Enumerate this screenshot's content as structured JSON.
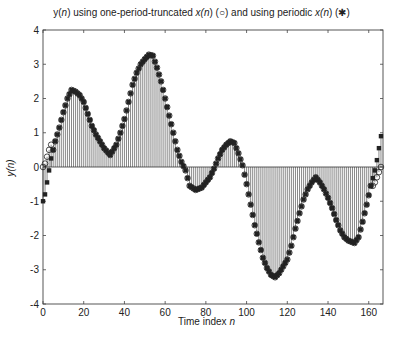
{
  "chart_data": {
    "type": "stem",
    "title": "y(n) using one-period-truncated x(n) (○) and using periodic x(n) (✱)",
    "title_parts": {
      "a": "y(",
      "a_n": "n",
      "b": ") using one-period-truncated ",
      "c": "x(",
      "c_n": "n",
      "d": ") (○) and using periodic ",
      "e": "x(",
      "e_n": "n",
      "f": ") (✱)"
    },
    "xlabel": "Time index n",
    "xlabel_parts": {
      "text": "Time index ",
      "var": "n"
    },
    "ylabel": "y(n)",
    "xlim": [
      0,
      167
    ],
    "ylim": [
      -4,
      4
    ],
    "xticks": [
      0,
      20,
      40,
      60,
      80,
      100,
      120,
      140,
      160
    ],
    "yticks": [
      -4,
      -3,
      -2,
      -1,
      0,
      1,
      2,
      3,
      4
    ],
    "grid": false,
    "n_range": [
      0,
      166
    ],
    "series": [
      {
        "name": "periodic x(n)",
        "marker": "asterisk",
        "control_points": [
          [
            0,
            -1.0
          ],
          [
            1,
            -0.8
          ],
          [
            2,
            -0.45
          ],
          [
            3,
            -0.1
          ],
          [
            4,
            0.25
          ],
          [
            6,
            0.75
          ],
          [
            8,
            1.15
          ],
          [
            10,
            1.6
          ],
          [
            12,
            2.0
          ],
          [
            14,
            2.25
          ],
          [
            16,
            2.2
          ],
          [
            18,
            2.1
          ],
          [
            20,
            1.9
          ],
          [
            22,
            1.55
          ],
          [
            24,
            1.2
          ],
          [
            26,
            0.95
          ],
          [
            28,
            0.75
          ],
          [
            30,
            0.55
          ],
          [
            33,
            0.35
          ],
          [
            36,
            0.65
          ],
          [
            38,
            1.0
          ],
          [
            40,
            1.4
          ],
          [
            42,
            1.9
          ],
          [
            44,
            2.4
          ],
          [
            46,
            2.75
          ],
          [
            48,
            3.0
          ],
          [
            50,
            3.15
          ],
          [
            52,
            3.28
          ],
          [
            54,
            3.25
          ],
          [
            56,
            2.9
          ],
          [
            58,
            2.5
          ],
          [
            60,
            2.0
          ],
          [
            62,
            1.5
          ],
          [
            64,
            1.0
          ],
          [
            66,
            0.5
          ],
          [
            68,
            0.15
          ],
          [
            70,
            -0.1
          ],
          [
            72,
            -0.55
          ],
          [
            75,
            -0.67
          ],
          [
            78,
            -0.6
          ],
          [
            80,
            -0.45
          ],
          [
            82,
            -0.3
          ],
          [
            84,
            -0.05
          ],
          [
            86,
            0.25
          ],
          [
            88,
            0.5
          ],
          [
            90,
            0.65
          ],
          [
            92,
            0.75
          ],
          [
            94,
            0.7
          ],
          [
            96,
            0.4
          ],
          [
            98,
            0.05
          ],
          [
            100,
            -0.5
          ],
          [
            102,
            -1.1
          ],
          [
            104,
            -1.7
          ],
          [
            106,
            -2.2
          ],
          [
            108,
            -2.65
          ],
          [
            110,
            -2.95
          ],
          [
            112,
            -3.15
          ],
          [
            114,
            -3.22
          ],
          [
            116,
            -3.1
          ],
          [
            118,
            -2.9
          ],
          [
            120,
            -2.7
          ],
          [
            122,
            -2.3
          ],
          [
            124,
            -1.8
          ],
          [
            126,
            -1.35
          ],
          [
            128,
            -0.95
          ],
          [
            130,
            -0.65
          ],
          [
            132,
            -0.45
          ],
          [
            134,
            -0.3
          ],
          [
            136,
            -0.45
          ],
          [
            138,
            -0.65
          ],
          [
            140,
            -0.9
          ],
          [
            142,
            -1.2
          ],
          [
            144,
            -1.55
          ],
          [
            146,
            -1.85
          ],
          [
            148,
            -2.05
          ],
          [
            150,
            -2.15
          ],
          [
            153,
            -2.22
          ],
          [
            155,
            -2.05
          ],
          [
            157,
            -1.6
          ],
          [
            159,
            -1.1
          ],
          [
            161,
            -0.55
          ],
          [
            163,
            -0.1
          ],
          [
            164,
            0.2
          ],
          [
            165,
            0.55
          ],
          [
            166,
            0.9
          ]
        ]
      },
      {
        "name": "one-period-truncated x(n)",
        "marker": "circle",
        "note": "identical to periodic except at the start and end transients",
        "overrides": [
          [
            0,
            0.0
          ],
          [
            1,
            0.1
          ],
          [
            2,
            0.3
          ],
          [
            3,
            0.5
          ],
          [
            4,
            0.65
          ],
          [
            162,
            -0.55
          ],
          [
            163,
            -0.45
          ],
          [
            164,
            -0.3
          ],
          [
            165,
            -0.15
          ],
          [
            166,
            0.0
          ]
        ]
      }
    ],
    "stem_fill": "vertical stem lines from 0 to each sample (dense gray hatch)"
  }
}
